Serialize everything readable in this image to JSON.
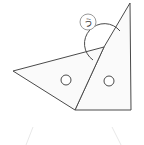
{
  "figure": {
    "background_color": "#ffffff",
    "stroke_color": "#4a4a4a",
    "fill_color": "#fafafa",
    "faint_stroke_color": "#e8e8e8",
    "angle_label": {
      "text": "う",
      "name": "angle-label-u",
      "circle_center_x": 88,
      "circle_center_y": 22,
      "circle_radius": 8,
      "circle_stroke": "#9a9a9a"
    },
    "shapes": {
      "left_triangle": {
        "name": "left-triangle",
        "points": "13,71 104,47 75,110"
      },
      "right_triangle": {
        "name": "right-triangle",
        "points": "104,47 130,3 131,110 75,110"
      }
    },
    "holes": [
      {
        "name": "hole-left",
        "cx": 66,
        "cy": 80,
        "r": 5
      },
      {
        "name": "hole-right",
        "cx": 109,
        "cy": 81,
        "r": 5
      }
    ],
    "angle_arc": {
      "name": "angle-arc",
      "path": "M 93 60 A 20 20 0 1 1 120 31"
    },
    "faint_marks": [
      {
        "name": "faint-mark-left",
        "path": "M 33 127 L 26 145"
      },
      {
        "name": "faint-mark-right",
        "path": "M 112 127 L 121 145"
      }
    ]
  }
}
